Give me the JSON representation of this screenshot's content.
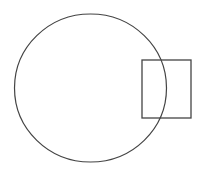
{
  "diagram": {
    "background": "#ffffff",
    "stroke_color": "#444444",
    "shapes": [
      {
        "type": "circle",
        "name": "circle",
        "cx": 90.5,
        "cy": 88,
        "rx": 76,
        "ry": 74
      },
      {
        "type": "rectangle",
        "name": "rectangle",
        "x": 142,
        "y": 60,
        "width": 49,
        "height": 58
      }
    ]
  }
}
